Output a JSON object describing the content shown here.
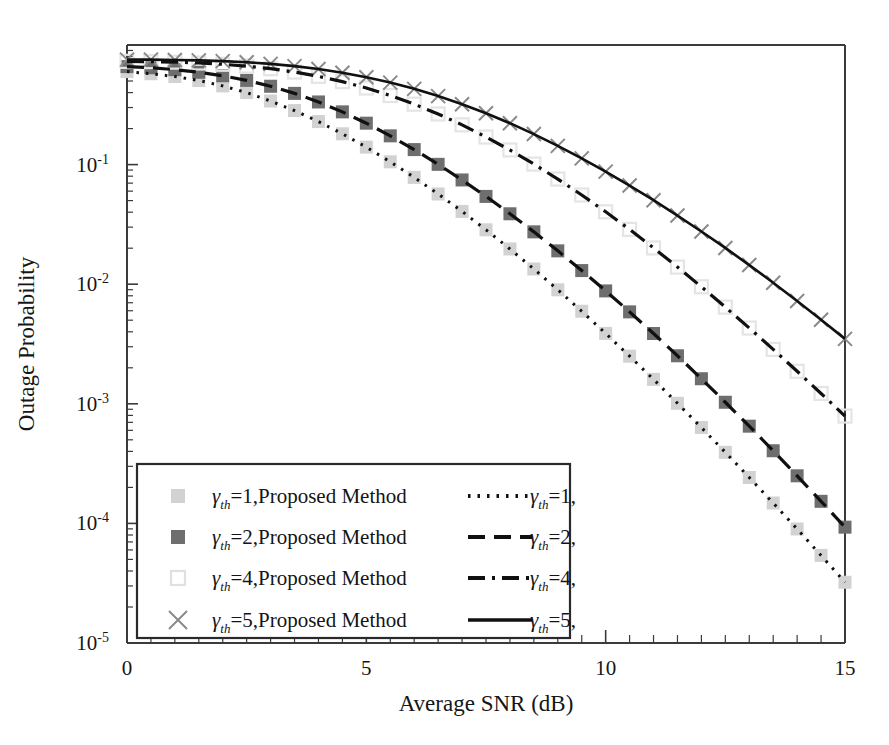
{
  "chart_data": {
    "type": "line",
    "title": "",
    "xlabel": "Average SNR (dB)",
    "ylabel": "Outage Probability",
    "xlim": [
      0,
      15
    ],
    "ylim": [
      1e-05,
      1.0
    ],
    "yscale": "log",
    "xticks": [
      "0",
      "5",
      "10",
      "15"
    ],
    "xtick_values": [
      0,
      5,
      10,
      15
    ],
    "yticks": [
      "10-1",
      "10-2",
      "10-3",
      "10-4",
      "10-5"
    ],
    "ytick_values": [
      0.1,
      0.01,
      0.001,
      0.0001,
      1e-05
    ],
    "grid": false,
    "legend_position": "lower-left-inside",
    "x": [
      0,
      0.5,
      1,
      1.5,
      2,
      2.5,
      3,
      3.5,
      4,
      4.5,
      5,
      5.5,
      6,
      6.5,
      7,
      7.5,
      8,
      8.5,
      9,
      9.5,
      10,
      10.5,
      11,
      11.5,
      12,
      12.5,
      13,
      13.5,
      14,
      14.5,
      15
    ],
    "series": [
      {
        "name": "gth1-proposed",
        "label_prefix": "γ",
        "label_sub": "th",
        "label_rest": "=1,Proposed Method",
        "style": "marker",
        "marker": "filled-square",
        "color": "#d2d2d2",
        "values": [
          0.6,
          0.575,
          0.545,
          0.505,
          0.455,
          0.4,
          0.34,
          0.283,
          0.229,
          0.181,
          0.14,
          0.1055,
          0.0782,
          0.0568,
          0.0406,
          0.0285,
          0.0197,
          0.0134,
          0.00898,
          0.00594,
          0.00388,
          0.0025,
          0.0016,
          0.00101,
          0.000633,
          0.000393,
          0.000242,
          0.000148,
          8.98e-05,
          5.4e-05,
          3.22e-05
        ]
      },
      {
        "name": "gth1-analytical",
        "label_prefix": "γ",
        "label_sub": "th",
        "label_rest": "=1,",
        "style": "dotted",
        "color": "#101010",
        "values": [
          0.6,
          0.575,
          0.545,
          0.505,
          0.455,
          0.4,
          0.34,
          0.283,
          0.229,
          0.181,
          0.14,
          0.1055,
          0.0782,
          0.0568,
          0.0406,
          0.0285,
          0.0197,
          0.0134,
          0.00898,
          0.00594,
          0.00388,
          0.0025,
          0.0016,
          0.00101,
          0.000633,
          0.000393,
          0.000242,
          0.000148,
          8.98e-05,
          5.4e-05,
          3.22e-05
        ]
      },
      {
        "name": "gth2-proposed",
        "label_prefix": "γ",
        "label_sub": "th",
        "label_rest": "=2,Proposed Method",
        "style": "marker",
        "marker": "filled-square",
        "color": "#6e6e6e",
        "values": [
          0.66,
          0.645,
          0.622,
          0.592,
          0.553,
          0.506,
          0.452,
          0.394,
          0.334,
          0.276,
          0.222,
          0.174,
          0.1335,
          0.1005,
          0.0744,
          0.0542,
          0.0388,
          0.0274,
          0.019,
          0.013,
          0.00879,
          0.00587,
          0.00387,
          0.00252,
          0.00162,
          0.00103,
          0.00065,
          0.000405,
          0.00025,
          0.000153,
          9.3e-05
        ]
      },
      {
        "name": "gth2-analytical",
        "label_prefix": "γ",
        "label_sub": "th",
        "label_rest": "=2,",
        "style": "dashed",
        "color": "#101010",
        "values": [
          0.66,
          0.645,
          0.622,
          0.592,
          0.553,
          0.506,
          0.452,
          0.394,
          0.334,
          0.276,
          0.222,
          0.174,
          0.1335,
          0.1005,
          0.0744,
          0.0542,
          0.0388,
          0.0274,
          0.019,
          0.013,
          0.00879,
          0.00587,
          0.00387,
          0.00252,
          0.00162,
          0.00103,
          0.00065,
          0.000405,
          0.00025,
          0.000153,
          9.3e-05
        ]
      },
      {
        "name": "gth4-proposed",
        "label_prefix": "γ",
        "label_sub": "th",
        "label_rest": "=4,Proposed Method",
        "style": "marker",
        "marker": "open-square",
        "color": "#e4e4e4",
        "values": [
          0.73,
          0.726,
          0.719,
          0.707,
          0.69,
          0.666,
          0.634,
          0.594,
          0.547,
          0.494,
          0.437,
          0.378,
          0.32,
          0.265,
          0.215,
          0.17,
          0.1325,
          0.101,
          0.0757,
          0.0557,
          0.0403,
          0.0287,
          0.0201,
          0.0139,
          0.00951,
          0.00643,
          0.0043,
          0.00285,
          0.00187,
          0.00122,
          0.00079
        ]
      },
      {
        "name": "gth4-analytical",
        "label_prefix": "γ",
        "label_sub": "th",
        "label_rest": "=4,",
        "style": "dashdot",
        "color": "#101010",
        "values": [
          0.73,
          0.726,
          0.719,
          0.707,
          0.69,
          0.666,
          0.634,
          0.594,
          0.547,
          0.494,
          0.437,
          0.378,
          0.32,
          0.265,
          0.215,
          0.17,
          0.1325,
          0.101,
          0.0757,
          0.0557,
          0.0403,
          0.0287,
          0.0201,
          0.0139,
          0.00951,
          0.00643,
          0.0043,
          0.00285,
          0.00187,
          0.00122,
          0.00079
        ]
      },
      {
        "name": "gth5-proposed",
        "label_prefix": "γ",
        "label_sub": "th",
        "label_rest": "=5,Proposed Method",
        "style": "marker",
        "marker": "cross",
        "color": "#8a8a8a",
        "values": [
          0.755,
          0.754,
          0.75,
          0.744,
          0.733,
          0.717,
          0.695,
          0.666,
          0.63,
          0.587,
          0.538,
          0.485,
          0.43,
          0.374,
          0.32,
          0.269,
          0.222,
          0.18,
          0.1435,
          0.1128,
          0.0874,
          0.0668,
          0.0504,
          0.0375,
          0.0276,
          0.0201,
          0.01445,
          0.01028,
          0.00724,
          0.00505,
          0.00349
        ]
      },
      {
        "name": "gth5-analytical",
        "label_prefix": "γ",
        "label_sub": "th",
        "label_rest": "=5,",
        "style": "solid",
        "color": "#101010",
        "values": [
          0.755,
          0.754,
          0.75,
          0.744,
          0.733,
          0.717,
          0.695,
          0.666,
          0.63,
          0.587,
          0.538,
          0.485,
          0.43,
          0.374,
          0.32,
          0.269,
          0.222,
          0.18,
          0.1435,
          0.1128,
          0.0874,
          0.0668,
          0.0504,
          0.0375,
          0.0276,
          0.0201,
          0.01445,
          0.01028,
          0.00724,
          0.00505,
          0.00349
        ]
      }
    ],
    "legend_entries": [
      {
        "marker": "filled-square",
        "color": "#d2d2d2",
        "prefix": "γ",
        "sub": "th",
        "rest": "=1,Proposed Method",
        "column": "left"
      },
      {
        "marker": "filled-square",
        "color": "#6e6e6e",
        "prefix": "γ",
        "sub": "th",
        "rest": "=2,Proposed Method",
        "column": "left"
      },
      {
        "marker": "open-square",
        "color": "#e0e0e0",
        "prefix": "γ",
        "sub": "th",
        "rest": "=4,Proposed Method",
        "column": "left"
      },
      {
        "marker": "cross",
        "color": "#8a8a8a",
        "prefix": "γ",
        "sub": "th",
        "rest": "=5,Proposed Method",
        "column": "left"
      },
      {
        "marker": "dotted",
        "color": "#101010",
        "prefix": "γ",
        "sub": "th",
        "rest": "=1,",
        "column": "right"
      },
      {
        "marker": "dashed",
        "color": "#101010",
        "prefix": "γ",
        "sub": "th",
        "rest": "=2,",
        "column": "right"
      },
      {
        "marker": "dashdot",
        "color": "#101010",
        "prefix": "γ",
        "sub": "th",
        "rest": "=4,",
        "column": "right"
      },
      {
        "marker": "solid",
        "color": "#101010",
        "prefix": "γ",
        "sub": "th",
        "rest": "=5,",
        "column": "right"
      }
    ]
  },
  "axes": {
    "x_title": "Average SNR (dB)",
    "y_title": "Outage Probability",
    "y_tick_mantissa": "10",
    "y_tick_exponents": [
      "-1",
      "-2",
      "-3",
      "-4",
      "-5"
    ],
    "x_tick_labels": [
      "0",
      "5",
      "10",
      "15"
    ]
  }
}
